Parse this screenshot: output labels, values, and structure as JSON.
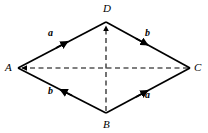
{
  "figure": {
    "type": "geometry-diagram",
    "shape": "rhombus",
    "background_color": "#ffffff",
    "stroke_color": "#000000",
    "vertices": [
      {
        "id": "A",
        "label": "A",
        "x": 18,
        "y": 68
      },
      {
        "id": "D",
        "label": "D",
        "x": 106,
        "y": 22
      },
      {
        "id": "C",
        "label": "C",
        "x": 190,
        "y": 68
      },
      {
        "id": "B",
        "label": "B",
        "x": 106,
        "y": 113
      }
    ],
    "sides": [
      {
        "id": "AD",
        "from": "A",
        "to": "D",
        "style": "solid",
        "arrow_at_midpoint": true,
        "arrow_direction": "toward-D",
        "label": "a"
      },
      {
        "id": "DC",
        "from": "D",
        "to": "C",
        "style": "solid",
        "arrow_at_midpoint": true,
        "arrow_direction": "toward-C",
        "label": "b"
      },
      {
        "id": "BA",
        "from": "B",
        "to": "A",
        "style": "solid",
        "arrow_at_midpoint": true,
        "arrow_direction": "toward-A",
        "label": "b"
      },
      {
        "id": "BC",
        "from": "B",
        "to": "C",
        "style": "solid",
        "arrow_at_midpoint": true,
        "arrow_direction": "toward-C",
        "label": "a"
      }
    ],
    "diagonals": [
      {
        "id": "CA",
        "from": "C",
        "to": "A",
        "style": "dashed",
        "arrow_at_end": true,
        "arrow_direction": "toward-A"
      },
      {
        "id": "BD",
        "from": "B",
        "to": "D",
        "style": "dashed",
        "arrow_at_end": true,
        "arrow_direction": "toward-D"
      }
    ],
    "vertex_labels": {
      "A": "A",
      "B": "B",
      "C": "C",
      "D": "D"
    },
    "vector_labels": {
      "a_on_AD": "a",
      "b_on_DC": "b",
      "b_on_AB": "b",
      "a_on_BC": "a"
    }
  }
}
